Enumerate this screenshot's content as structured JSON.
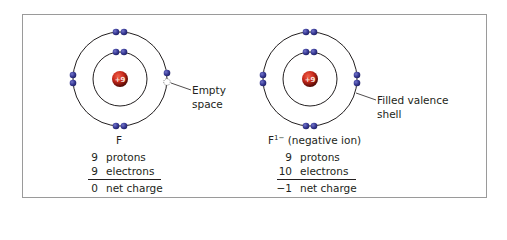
{
  "colors": {
    "frame": "#9a9a9a",
    "orbit": "#231f20",
    "electron": "#3a3c97",
    "electron_dark": "#1e1f63",
    "nucleus": "#d8321f",
    "nucleus_dark": "#4a0805",
    "text": "#231f20"
  },
  "left_atom": {
    "label": "F",
    "nucleus_charge": "+9",
    "rows": [
      {
        "num": "9",
        "text": "protons"
      },
      {
        "num": "9",
        "text": "electrons"
      },
      {
        "num": "0",
        "text": "net charge"
      }
    ],
    "callout": {
      "line1": "Empty",
      "line2": "space"
    },
    "inner_shell_electrons": 2,
    "outer_shell_electrons": 7
  },
  "right_atom": {
    "label_base": "F",
    "label_sup": "1−",
    "label_rest": " (negative ion)",
    "nucleus_charge": "+9",
    "rows": [
      {
        "num": "9",
        "text": "protons"
      },
      {
        "num": "10",
        "text": "electrons"
      },
      {
        "num": "−1",
        "text": "net charge"
      }
    ],
    "callout": {
      "line1": "Filled valence",
      "line2": "shell"
    },
    "inner_shell_electrons": 2,
    "outer_shell_electrons": 8
  }
}
